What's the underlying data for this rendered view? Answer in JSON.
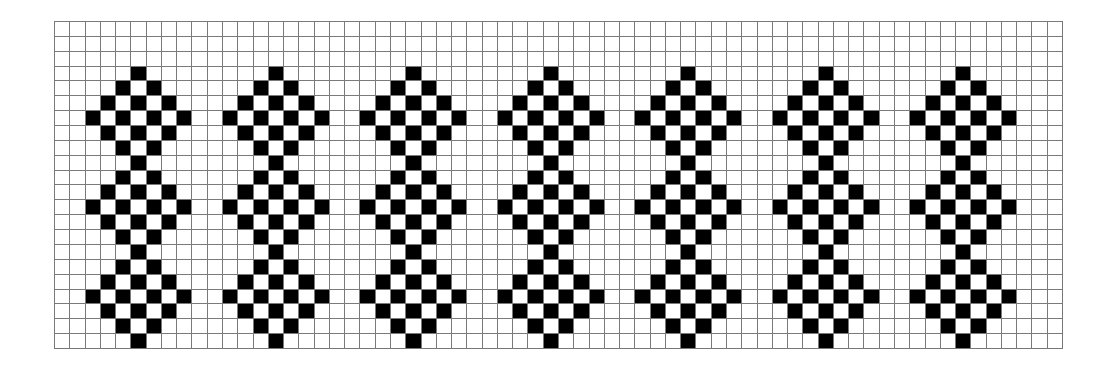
{
  "grid": {
    "columns": 66,
    "rows": 22,
    "fill_color": "#000000",
    "empty_color": "#ffffff",
    "line_color": "#7a7a7a"
  },
  "motif": {
    "count": 7,
    "repeat_every_columns": 9,
    "first_center_column": 5,
    "rows": {
      "3": [
        0
      ],
      "4": [
        -1,
        1
      ],
      "5": [
        -2,
        0,
        2
      ],
      "6": [
        -3,
        -1,
        1,
        3
      ],
      "7": [
        -2,
        0,
        2
      ],
      "8": [
        -1,
        1
      ],
      "9": [
        0
      ],
      "10": [
        -1,
        1
      ],
      "11": [
        -2,
        0,
        2
      ],
      "12": [
        -3,
        -1,
        1,
        3
      ],
      "13": [
        -2,
        0,
        2
      ],
      "14": [
        -1,
        1
      ],
      "15": [
        0
      ],
      "16": [
        -1,
        1
      ],
      "17": [
        -2,
        0,
        2
      ],
      "18": [
        -3,
        -1,
        1,
        3
      ],
      "19": [
        -2,
        0,
        2
      ],
      "20": [
        -1,
        1
      ],
      "21": [
        0
      ]
    }
  }
}
